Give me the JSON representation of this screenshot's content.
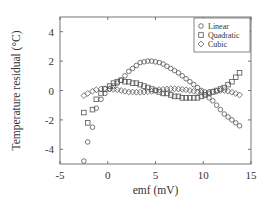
{
  "chart_data": {
    "type": "scatter",
    "title": "",
    "xlabel": "emf (mV)",
    "ylabel": "Temperature residual   (°C)",
    "xlim": [
      -5,
      15
    ],
    "ylim": [
      -5,
      5
    ],
    "xticks": [
      -5,
      0,
      5,
      10,
      15
    ],
    "yticks": [
      -4,
      -2,
      0,
      2,
      4
    ],
    "xtick_labels": [
      "-5",
      "0",
      "5",
      "10",
      "15"
    ],
    "ytick_labels": [
      "-4",
      "-2",
      "0",
      "2",
      "4"
    ],
    "grid": false,
    "legend_position": "top-right",
    "series": [
      {
        "name": "Linear",
        "marker": "circle",
        "x": [
          -2.5,
          -2.1,
          -1.6,
          -1.2,
          -0.7,
          -0.3,
          0.2,
          0.6,
          1.0,
          1.4,
          1.8,
          2.2,
          2.6,
          3.0,
          3.4,
          3.8,
          4.2,
          4.6,
          5.0,
          5.4,
          5.8,
          6.2,
          6.6,
          7.0,
          7.4,
          7.8,
          8.2,
          8.6,
          9.0,
          9.4,
          9.8,
          10.2,
          10.6,
          11.0,
          11.4,
          11.8,
          12.2,
          12.6,
          13.0,
          13.4,
          13.8
        ],
        "y": [
          -4.8,
          -3.5,
          -2.5,
          -1.2,
          -0.6,
          -0.2,
          0.1,
          0.3,
          0.5,
          0.7,
          1.0,
          1.3,
          1.5,
          1.7,
          1.9,
          1.95,
          2.0,
          2.0,
          1.95,
          1.9,
          1.8,
          1.65,
          1.5,
          1.35,
          1.2,
          1.0,
          0.8,
          0.6,
          0.4,
          0.2,
          0.0,
          -0.3,
          -0.5,
          -0.7,
          -1.0,
          -1.3,
          -1.6,
          -1.8,
          -2.0,
          -2.2,
          -2.4
        ]
      },
      {
        "name": "Quadratic",
        "marker": "square",
        "x": [
          -2.5,
          -2.1,
          -1.6,
          -1.2,
          -0.7,
          -0.3,
          0.2,
          0.6,
          1.0,
          1.4,
          1.8,
          2.2,
          2.6,
          3.0,
          3.4,
          3.8,
          4.2,
          4.6,
          5.0,
          5.4,
          5.8,
          6.2,
          6.6,
          7.0,
          7.4,
          7.8,
          8.2,
          8.6,
          9.0,
          9.4,
          9.8,
          10.2,
          10.6,
          11.0,
          11.4,
          11.8,
          12.2,
          12.6,
          13.0,
          13.4,
          13.8
        ],
        "y": [
          -1.5,
          -2.2,
          -1.3,
          -0.6,
          -0.2,
          0.1,
          0.3,
          0.5,
          0.6,
          0.7,
          0.6,
          0.6,
          0.5,
          0.5,
          0.4,
          0.3,
          0.2,
          0.1,
          0.0,
          -0.1,
          -0.2,
          -0.2,
          -0.3,
          -0.4,
          -0.4,
          -0.5,
          -0.5,
          -0.5,
          -0.5,
          -0.5,
          -0.4,
          -0.3,
          -0.2,
          -0.1,
          0.0,
          0.1,
          0.2,
          0.4,
          0.6,
          0.9,
          1.2
        ]
      },
      {
        "name": "Cubic",
        "marker": "diamond",
        "x": [
          -2.5,
          -2.1,
          -1.6,
          -1.2,
          -0.7,
          -0.3,
          0.2,
          0.6,
          1.0,
          1.4,
          1.8,
          2.2,
          2.6,
          3.0,
          3.4,
          3.8,
          4.2,
          4.6,
          5.0,
          5.4,
          5.8,
          6.2,
          6.6,
          7.0,
          7.4,
          7.8,
          8.2,
          8.6,
          9.0,
          9.4,
          9.8,
          10.2,
          10.6,
          11.0,
          11.4,
          11.8,
          12.2,
          12.6,
          13.0,
          13.4,
          13.8
        ],
        "y": [
          -0.35,
          -0.2,
          -0.05,
          0.05,
          0.1,
          0.12,
          0.1,
          0.08,
          0.05,
          0.0,
          -0.05,
          -0.1,
          -0.1,
          -0.12,
          -0.12,
          -0.1,
          -0.08,
          -0.05,
          0.0,
          0.05,
          0.08,
          0.1,
          0.12,
          0.12,
          0.1,
          0.08,
          0.05,
          0.0,
          -0.05,
          -0.1,
          -0.12,
          -0.12,
          -0.1,
          -0.08,
          -0.05,
          0.0,
          0.0,
          -0.05,
          -0.12,
          -0.2,
          -0.3
        ]
      }
    ]
  }
}
